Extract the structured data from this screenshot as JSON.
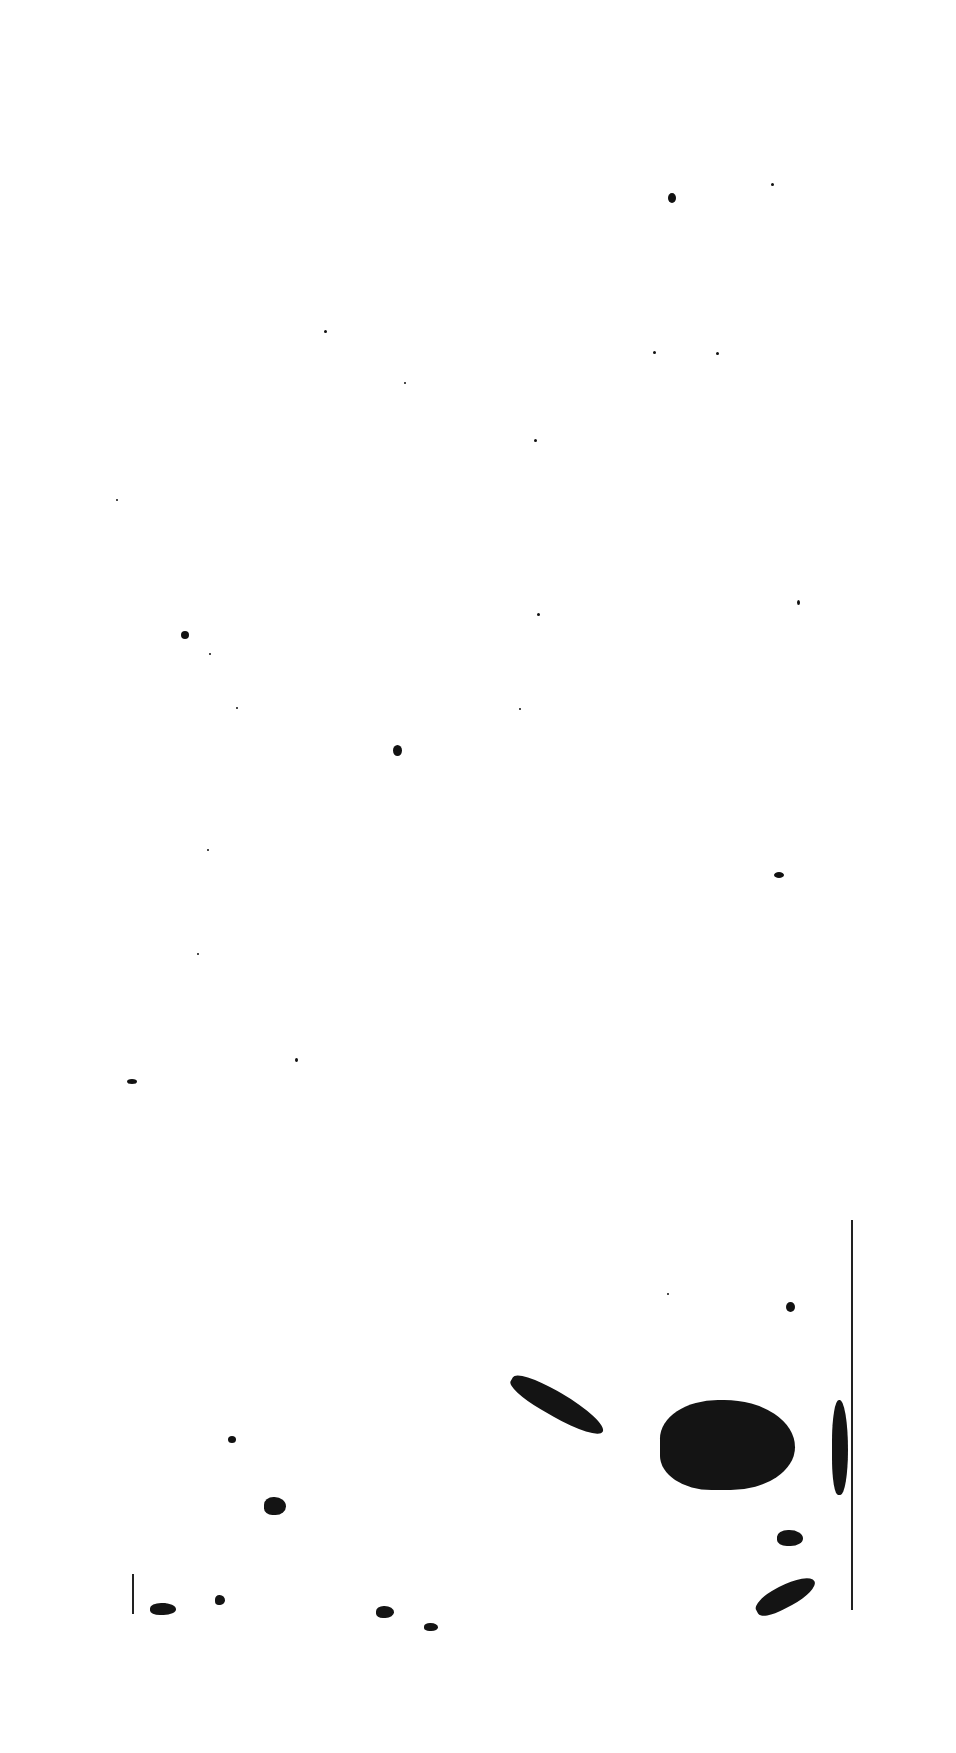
{
  "page": {
    "type": "scanned-blank-page",
    "background": "#ffffff",
    "ink_color": "#141414",
    "text": ""
  },
  "specks": [
    {
      "x": 668,
      "y": 193,
      "w": 8,
      "h": 10
    },
    {
      "x": 771,
      "y": 183,
      "w": 3,
      "h": 3
    },
    {
      "x": 324,
      "y": 330,
      "w": 3,
      "h": 3
    },
    {
      "x": 404,
      "y": 382,
      "w": 2,
      "h": 2
    },
    {
      "x": 653,
      "y": 351,
      "w": 3,
      "h": 3
    },
    {
      "x": 716,
      "y": 352,
      "w": 3,
      "h": 3
    },
    {
      "x": 534,
      "y": 439,
      "w": 3,
      "h": 3
    },
    {
      "x": 116,
      "y": 499,
      "w": 2,
      "h": 2
    },
    {
      "x": 797,
      "y": 600,
      "w": 3,
      "h": 5
    },
    {
      "x": 181,
      "y": 631,
      "w": 8,
      "h": 8
    },
    {
      "x": 209,
      "y": 653,
      "w": 2,
      "h": 2
    },
    {
      "x": 537,
      "y": 613,
      "w": 3,
      "h": 3
    },
    {
      "x": 236,
      "y": 707,
      "w": 2,
      "h": 2
    },
    {
      "x": 519,
      "y": 708,
      "w": 2,
      "h": 2
    },
    {
      "x": 393,
      "y": 745,
      "w": 9,
      "h": 11
    },
    {
      "x": 207,
      "y": 849,
      "w": 2,
      "h": 2
    },
    {
      "x": 774,
      "y": 872,
      "w": 10,
      "h": 6
    },
    {
      "x": 197,
      "y": 953,
      "w": 2,
      "h": 2
    },
    {
      "x": 127,
      "y": 1079,
      "w": 10,
      "h": 5
    },
    {
      "x": 295,
      "y": 1058,
      "w": 3,
      "h": 4
    },
    {
      "x": 786,
      "y": 1302,
      "w": 9,
      "h": 10
    },
    {
      "x": 667,
      "y": 1293,
      "w": 2,
      "h": 2
    },
    {
      "x": 228,
      "y": 1436,
      "w": 8,
      "h": 7
    },
    {
      "x": 161,
      "y": 1603,
      "w": 6,
      "h": 6
    }
  ],
  "blobs": [
    {
      "x": 505,
      "y": 1393,
      "w": 105,
      "h": 24,
      "rotate": 30
    },
    {
      "x": 660,
      "y": 1400,
      "w": 135,
      "h": 90,
      "rotate": 0
    },
    {
      "x": 753,
      "y": 1585,
      "w": 65,
      "h": 22,
      "rotate": -28
    },
    {
      "x": 777,
      "y": 1530,
      "w": 26,
      "h": 16,
      "rotate": 0
    },
    {
      "x": 832,
      "y": 1400,
      "w": 16,
      "h": 95,
      "rotate": 0
    },
    {
      "x": 264,
      "y": 1497,
      "w": 22,
      "h": 18,
      "rotate": 0
    },
    {
      "x": 150,
      "y": 1603,
      "w": 26,
      "h": 12,
      "rotate": 0
    },
    {
      "x": 376,
      "y": 1606,
      "w": 18,
      "h": 12,
      "rotate": 0
    },
    {
      "x": 424,
      "y": 1623,
      "w": 14,
      "h": 8,
      "rotate": 0
    },
    {
      "x": 215,
      "y": 1595,
      "w": 10,
      "h": 10,
      "rotate": 0
    }
  ],
  "edge_lines": [
    {
      "x": 851,
      "y": 1220,
      "w": 2,
      "h": 390
    },
    {
      "x": 132,
      "y": 1574,
      "w": 2,
      "h": 40
    }
  ]
}
